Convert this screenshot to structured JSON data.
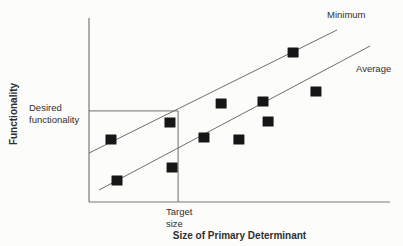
{
  "figure": {
    "background": "#fcfcfb"
  },
  "chart_data": {
    "type": "scatter",
    "title": "",
    "xlabel": "Size of Primary Determinant",
    "ylabel": "Functionality",
    "xlim": [
      0,
      100
    ],
    "ylim": [
      0,
      100
    ],
    "axes_note": "axes have no tick marks or numeric labels; coordinates normalized 0-100",
    "grid": false,
    "legend": "inline labels at upper-right ends of trend lines",
    "marker": {
      "shape": "square",
      "size_px": 11,
      "color": "#161616"
    },
    "line_color": "#6e6e6e",
    "axis_color": "#787878",
    "text_color": "#2f2f2f",
    "points": [
      {
        "x": 7.3,
        "y": 33.7
      },
      {
        "x": 9.3,
        "y": 11.4
      },
      {
        "x": 26.9,
        "y": 42.9
      },
      {
        "x": 27.6,
        "y": 18.5
      },
      {
        "x": 38.2,
        "y": 34.8
      },
      {
        "x": 43.9,
        "y": 53.3
      },
      {
        "x": 49.8,
        "y": 33.7
      },
      {
        "x": 57.8,
        "y": 54.3
      },
      {
        "x": 59.5,
        "y": 43.5
      },
      {
        "x": 67.8,
        "y": 81.0
      },
      {
        "x": 75.4,
        "y": 59.8
      }
    ],
    "lines": [
      {
        "label": "Minimum",
        "x1": 0,
        "y1": 26.6,
        "x2": 82.4,
        "y2": 93.5
      },
      {
        "label": "Average",
        "x1": 3.3,
        "y1": 6.5,
        "x2": 93.4,
        "y2": 84.8
      }
    ],
    "annotations": {
      "desired_functionality_label": "Desired\nfunctionality",
      "desired_functionality_y": 49.5,
      "target_size_label": "Target\nsize",
      "target_size_x": 29.6
    }
  }
}
